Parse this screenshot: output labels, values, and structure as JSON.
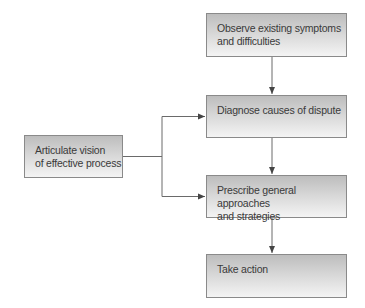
{
  "diagram": {
    "nodes": [
      {
        "id": "observe",
        "lines": [
          "Observe existing symptoms",
          "and difficulties"
        ]
      },
      {
        "id": "diagnose",
        "lines": [
          "Diagnose causes of dispute"
        ]
      },
      {
        "id": "prescribe",
        "lines": [
          "Prescribe general approaches",
          "and strategies"
        ]
      },
      {
        "id": "act",
        "lines": [
          "Take action"
        ]
      },
      {
        "id": "vision",
        "lines": [
          "Articulate vision",
          "of effective process"
        ]
      }
    ],
    "edges": [
      {
        "from": "observe",
        "to": "diagnose"
      },
      {
        "from": "diagnose",
        "to": "prescribe"
      },
      {
        "from": "prescribe",
        "to": "act"
      },
      {
        "from": "vision",
        "to": "diagnose"
      },
      {
        "from": "vision",
        "to": "prescribe"
      }
    ],
    "colors": {
      "border": "#8a8a8a",
      "line": "#5a5a5a",
      "text": "#3a3a3a"
    }
  }
}
